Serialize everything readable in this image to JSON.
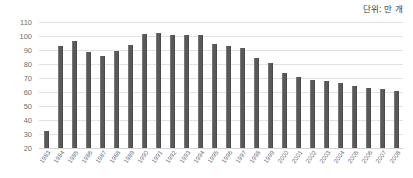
{
  "chart_data": {
    "type": "bar",
    "title": "",
    "subtitle": "",
    "unit_label": "단위: 만 개",
    "xlabel": "",
    "ylabel": "",
    "ylim": [
      20,
      110
    ],
    "ytick_step": 10,
    "yticks": [
      "110",
      "100",
      "90",
      "80",
      "70",
      "60",
      "50",
      "40",
      "30",
      "20"
    ],
    "grid": true,
    "grid_axis": "y",
    "legend": false,
    "legend_position": "none",
    "bar_color": "#595959",
    "grid_color": "#e2e2e2",
    "axis_text_color": "#6f6f6f",
    "categories": [
      "1983",
      "1984",
      "1985",
      "1986",
      "1987",
      "1988",
      "1989",
      "1990",
      "1991",
      "1992",
      "1993",
      "1994",
      "1995",
      "1996",
      "1997",
      "1998",
      "1999",
      "2000",
      "2001",
      "2002",
      "2003",
      "2004",
      "2005",
      "2006",
      "2007",
      "2008"
    ],
    "values": [
      32.5,
      92.8,
      96.4,
      88.3,
      85.8,
      89.2,
      93.5,
      101.2,
      102.2,
      100.9,
      100.8,
      100.9,
      94.5,
      93.2,
      91.1,
      84.4,
      81.0,
      73.5,
      70.6,
      68.4,
      67.6,
      66.2,
      64.6,
      63.2,
      61.8,
      61.0
    ]
  }
}
